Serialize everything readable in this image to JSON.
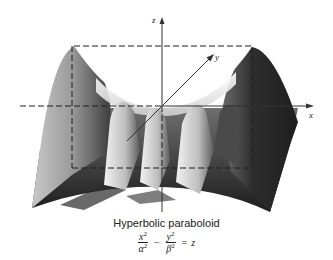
{
  "figure": {
    "title": "Hyperbolic paraboloid",
    "equation": {
      "term1_num": "x",
      "term1_den": "α",
      "term2_num": "y",
      "term2_den": "β",
      "exponent": "2",
      "operator": "−",
      "equals": "=",
      "rhs": "z"
    },
    "axes": {
      "x_label": "x",
      "y_label": "y",
      "z_label": "z"
    },
    "colors": {
      "axis": "#333333",
      "surface_dark": "#2a2a2a",
      "surface_light": "#e8e8e8",
      "background": "#ffffff"
    }
  }
}
